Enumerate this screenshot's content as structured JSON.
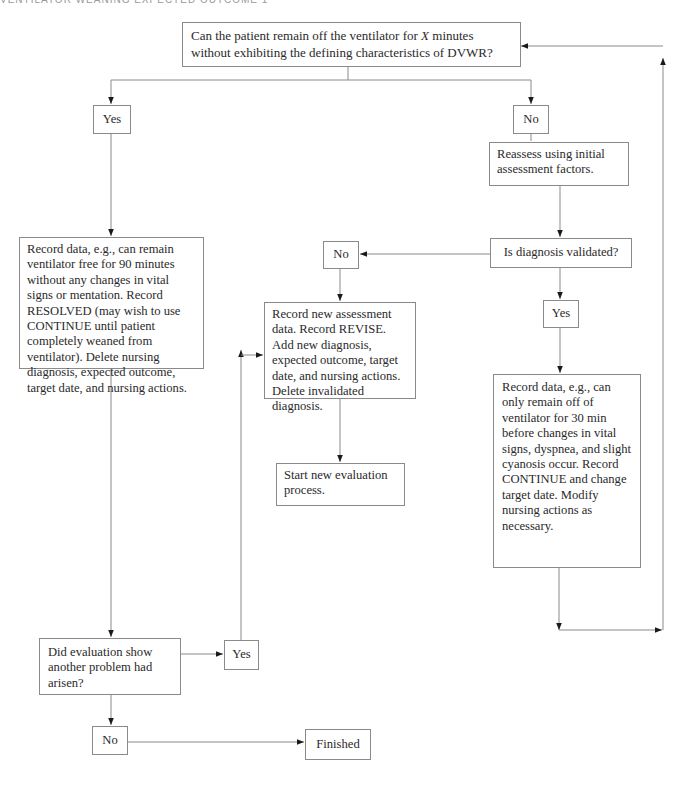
{
  "running_head": "VENTILATOR WEANING EXPECTED OUTCOME 1",
  "nodes": {
    "question_top": {
      "pre": "Can the patient remain off the ventilator for ",
      "var": "X",
      "post": " minutes without exhibiting the defining characteristics of DVWR?"
    },
    "yes_left": "Yes",
    "no_right": "No",
    "reassess": "Reassess using initial assessment factors.",
    "is_validated": "Is diagnosis validated?",
    "no_mid": "No",
    "yes_right": "Yes",
    "record_resolved": "Record data, e.g., can remain ventilator free for 90 minutes without any changes in vital signs or mentation. Record RESOLVED (may wish to use CONTINUE until patient completely weaned from ventilator). Delete nursing diagnosis, expected outcome, target date, and nursing actions.",
    "record_revise": "Record new assessment data. Record REVISE. Add new diagnosis, expected outcome, target date, and nursing actions. Delete invalidated diagnosis.",
    "start_new": "Start new evaluation process.",
    "record_continue": "Record data, e.g., can only remain off of ventilator for 30 min before changes in vital signs, dyspnea, and slight cyanosis occur. Record CONTINUE and change target date. Modify nursing actions as necessary.",
    "did_eval": "Did evaluation show another problem had arisen?",
    "yes_bottom": "Yes",
    "no_bottom": "No",
    "finished": "Finished"
  },
  "colors": {
    "line": "#8a8a8a",
    "arrow": "#1a1a1a",
    "text": "#2a2a2a"
  }
}
